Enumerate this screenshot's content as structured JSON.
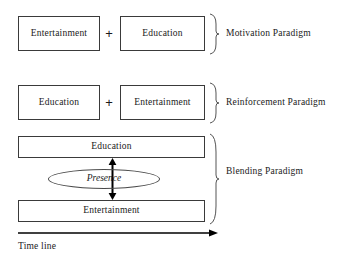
{
  "diagram": {
    "colors": {
      "background": "#ffffff",
      "box_border": "#3a3a3a",
      "text": "#1a1a1a",
      "arrow": "#000000",
      "ellipse_border": "#4a4a4a"
    },
    "rows": [
      {
        "id": "motivation",
        "paradigm_label": "Motivation Paradigm",
        "operator": "+",
        "boxes": [
          {
            "label": "Entertainment"
          },
          {
            "label": "Education"
          }
        ]
      },
      {
        "id": "reinforcement",
        "paradigm_label": "Reinforcement Paradigm",
        "operator": "+",
        "boxes": [
          {
            "label": "Education"
          },
          {
            "label": "Entertainment"
          }
        ]
      },
      {
        "id": "blending",
        "paradigm_label": "Blending Paradigm",
        "boxes": [
          {
            "label": "Education"
          },
          {
            "label": "Entertainment"
          }
        ],
        "ellipse_label": "Presence",
        "vertical_arrow": "double-headed-vertical-arrow"
      }
    ],
    "axis": {
      "label": "Time line",
      "direction": "right"
    },
    "icons": {
      "brace": "right-curly-brace",
      "timeline_arrow": "arrow-right-icon",
      "presence_arrow": "arrow-up-down-icon"
    }
  }
}
